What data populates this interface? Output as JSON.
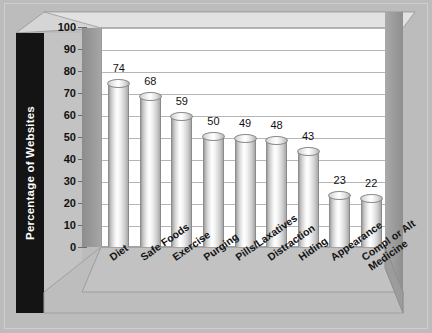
{
  "chart_data": {
    "type": "bar",
    "title": "",
    "xlabel": "",
    "ylabel": "Percentage of Websites",
    "ylim": [
      0,
      100
    ],
    "grid": true,
    "legend": "none",
    "style": "3d-cylinder-bars",
    "categories": [
      "Diet",
      "Safe Foods",
      "Exercise",
      "Purging",
      "Pills/Laxatives",
      "Distraction",
      "Hiding",
      "Appearance",
      "Compl or Alt Medicine"
    ],
    "values": [
      74,
      68,
      59,
      50,
      49,
      48,
      43,
      23,
      22
    ],
    "yticks": [
      0,
      10,
      20,
      30,
      40,
      50,
      60,
      70,
      80,
      90,
      100
    ],
    "colors": {
      "background": "#bcbcbc",
      "plot_background": "#ffffff",
      "gridline": "#b5b5b9",
      "axis_title_band": "#141414",
      "axis_title_text": "#ffffff",
      "bar_light": "#ffffff",
      "bar_dark": "#9d9d9d",
      "wall": "#9a9a9a",
      "floor": "#bdbdbd"
    }
  }
}
